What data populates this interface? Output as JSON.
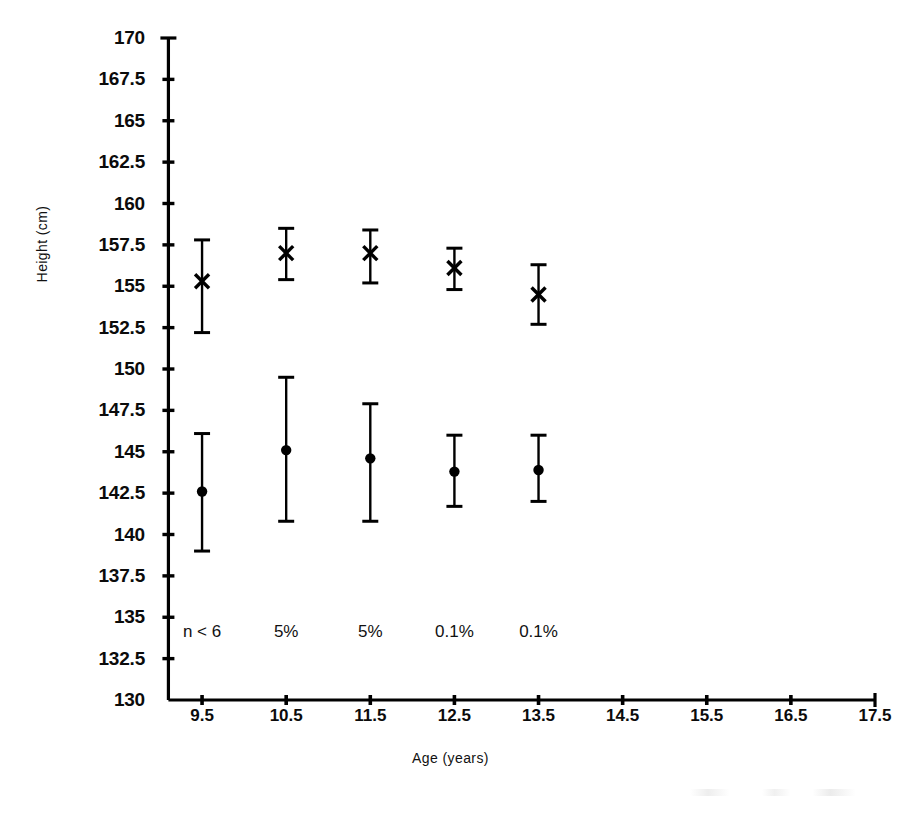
{
  "chart_data": {
    "type": "scatter",
    "title": "",
    "xlabel": "Age (years)",
    "ylabel": "Height (cm)",
    "xlim": [
      9.0,
      17.5
    ],
    "ylim": [
      130,
      170
    ],
    "grid": false,
    "legend_position": "none",
    "x": [
      9.5,
      10.5,
      11.5,
      12.5,
      13.5
    ],
    "xticks": [
      "9.5",
      "10.5",
      "11.5",
      "12.5",
      "13.5",
      "14.5",
      "15.5",
      "16.5",
      "17.5"
    ],
    "yticks": [
      "170",
      "167.5",
      "165",
      "162.5",
      "160",
      "157.5",
      "155",
      "152.5",
      "150",
      "147.5",
      "145",
      "142.5",
      "140",
      "137.5",
      "135",
      "132.5",
      "130"
    ],
    "annotations": [
      "n < 6",
      "5%",
      "5%",
      "0.1%",
      "0.1%"
    ],
    "series": [
      {
        "name": "upper-series",
        "marker": "cross",
        "values": [
          155.3,
          157.0,
          157.0,
          156.1,
          154.5
        ],
        "err_low": [
          152.2,
          155.4,
          155.2,
          154.8,
          152.7
        ],
        "err_high": [
          157.8,
          158.5,
          158.4,
          157.3,
          156.3
        ]
      },
      {
        "name": "lower-series",
        "marker": "circle",
        "values": [
          142.6,
          145.1,
          144.6,
          143.8,
          143.9
        ],
        "err_low": [
          139.0,
          140.8,
          140.8,
          141.7,
          142.0
        ],
        "err_high": [
          146.1,
          149.5,
          147.9,
          146.0,
          146.0
        ]
      }
    ]
  },
  "axis": {
    "y_label": "Height (cm)",
    "x_label": "Age (years)"
  }
}
